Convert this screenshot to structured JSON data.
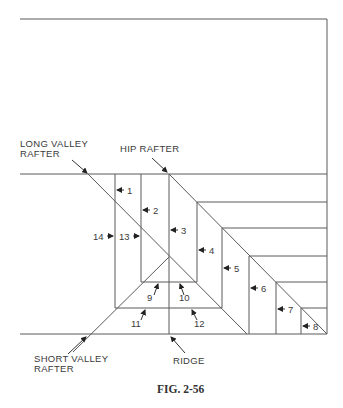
{
  "figure": {
    "caption": "FIG. 2-56",
    "labels": {
      "long_valley_rafter_line1": "LONG VALLEY",
      "long_valley_rafter_line2": "RAFTER",
      "hip_rafter": "HIP RAFTER",
      "short_valley_rafter_line1": "SHORT VALLEY",
      "short_valley_rafter_line2": "RAFTER",
      "ridge": "RIDGE"
    },
    "numbers": {
      "n1": "1",
      "n2": "2",
      "n3": "3",
      "n4": "4",
      "n5": "5",
      "n6": "6",
      "n7": "7",
      "n8": "8",
      "n9": "9",
      "n10": "10",
      "n11": "11",
      "n12": "12",
      "n13": "13",
      "n14": "14"
    }
  }
}
